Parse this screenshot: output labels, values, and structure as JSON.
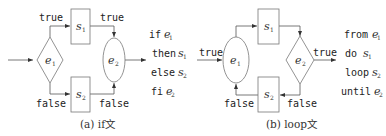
{
  "diagram_a": {
    "caption": "(a) if文",
    "nodes": {
      "e1": {
        "var": "e",
        "sub": "1",
        "shape": "diamond"
      },
      "s1": {
        "var": "s",
        "sub": "1",
        "shape": "box"
      },
      "s2": {
        "var": "s",
        "sub": "2",
        "shape": "box"
      },
      "e2": {
        "var": "e",
        "sub": "2",
        "shape": "ellipse"
      }
    },
    "edge_labels": {
      "true_left": "true",
      "true_right": "true",
      "false_left": "false",
      "false_right": "false"
    },
    "code": [
      {
        "kw": "if",
        "var": "e",
        "sub": "1"
      },
      {
        "kw": "then",
        "var": "s",
        "sub": "1"
      },
      {
        "kw": "else",
        "var": "s",
        "sub": "2"
      },
      {
        "kw": "fi",
        "var": "e",
        "sub": "2"
      }
    ]
  },
  "diagram_b": {
    "caption": "(b) loop文",
    "nodes": {
      "e1": {
        "var": "e",
        "sub": "1",
        "shape": "ellipse"
      },
      "s1": {
        "var": "s",
        "sub": "1",
        "shape": "box"
      },
      "s2": {
        "var": "s",
        "sub": "2",
        "shape": "box"
      },
      "e2": {
        "var": "e",
        "sub": "2",
        "shape": "diamond"
      }
    },
    "edge_labels": {
      "true_in": "true",
      "true_out": "true",
      "false_left": "false",
      "false_right": "false"
    },
    "code": [
      {
        "kw": "from",
        "var": "e",
        "sub": "1"
      },
      {
        "kw": "do",
        "var": "s",
        "sub": "1"
      },
      {
        "kw": "loop",
        "var": "s",
        "sub": "2"
      },
      {
        "kw": "until",
        "var": "e",
        "sub": "2"
      }
    ]
  }
}
